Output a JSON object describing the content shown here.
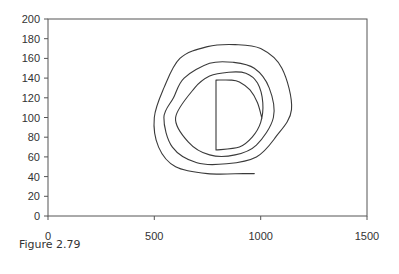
{
  "chart_data": {
    "type": "line",
    "title": "",
    "xlabel": "",
    "ylabel": "",
    "xlim": [
      0,
      1500
    ],
    "ylim": [
      0,
      200
    ],
    "x_ticks": [
      0,
      500,
      1000,
      1500
    ],
    "y_ticks": [
      0,
      20,
      40,
      60,
      80,
      100,
      120,
      140,
      160,
      180,
      200
    ],
    "grid": false,
    "legend": null,
    "series": [
      {
        "name": "spiral",
        "color": "#333333",
        "description": "Inward-to-outward spiral starting with a D-shaped core (vertical segment at x≈790 from y≈67 to y≈138) and winding outward about four times, ending near (970, 43)",
        "points": [
          [
            1006,
            99
          ],
          [
            985,
            115
          ],
          [
            950,
            128
          ],
          [
            900,
            136
          ],
          [
            860,
            138
          ],
          [
            790,
            138
          ],
          [
            790,
            67
          ],
          [
            900,
            70
          ],
          [
            960,
            80
          ],
          [
            1000,
            95
          ],
          [
            1010,
            115
          ],
          [
            985,
            135
          ],
          [
            930,
            145
          ],
          [
            850,
            146
          ],
          [
            760,
            142
          ],
          [
            690,
            130
          ],
          [
            600,
            100
          ],
          [
            660,
            75
          ],
          [
            760,
            62
          ],
          [
            880,
            62
          ],
          [
            980,
            72
          ],
          [
            1060,
            100
          ],
          [
            1040,
            130
          ],
          [
            970,
            150
          ],
          [
            870,
            156
          ],
          [
            760,
            155
          ],
          [
            640,
            140
          ],
          [
            590,
            120
          ],
          [
            545,
            100
          ],
          [
            585,
            70
          ],
          [
            700,
            54
          ],
          [
            840,
            53
          ],
          [
            980,
            60
          ],
          [
            1070,
            80
          ],
          [
            1145,
            108
          ],
          [
            1100,
            150
          ],
          [
            1000,
            170
          ],
          [
            880,
            174
          ],
          [
            750,
            172
          ],
          [
            620,
            160
          ],
          [
            545,
            130
          ],
          [
            500,
            100
          ],
          [
            520,
            70
          ],
          [
            600,
            50
          ],
          [
            750,
            43
          ],
          [
            920,
            43
          ],
          [
            970,
            43
          ]
        ]
      }
    ]
  },
  "axes": {
    "x_tick_labels": [
      "0",
      "500",
      "1000",
      "1500"
    ],
    "y_tick_labels": [
      "0",
      "20",
      "40",
      "60",
      "80",
      "100",
      "120",
      "140",
      "160",
      "180",
      "200"
    ]
  },
  "caption": "Figure 2.79"
}
